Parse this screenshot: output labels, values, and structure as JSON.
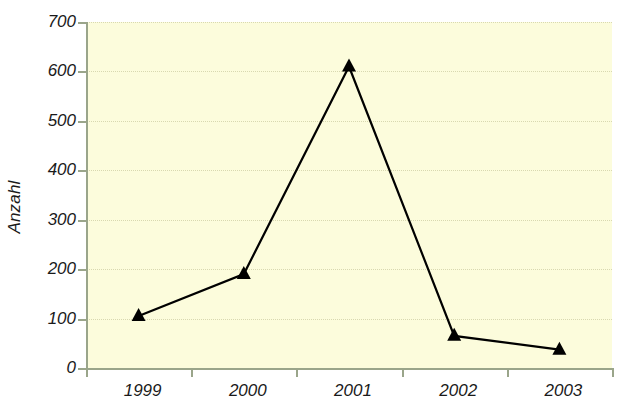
{
  "chart_data": {
    "type": "line",
    "title": "",
    "xlabel": "",
    "ylabel": "Anzahl",
    "categories": [
      "1999",
      "2000",
      "2001",
      "2002",
      "2003"
    ],
    "values": [
      105,
      190,
      610,
      65,
      37
    ],
    "series": [
      {
        "name": "Anzahl",
        "values": [
          105,
          190,
          610,
          65,
          37
        ]
      }
    ],
    "ylim": [
      0,
      700
    ],
    "y_ticks": [
      0,
      100,
      200,
      300,
      400,
      500,
      600,
      700
    ],
    "y_tick_labels": [
      "0",
      "100",
      "200",
      "300",
      "400",
      "500",
      "600",
      "700"
    ],
    "grid": true,
    "grid_axis": "y",
    "legend": false,
    "legend_position": "none",
    "marker": "triangle",
    "marker_color": "#000000",
    "line_color": "#000000",
    "plot_background": "#fcfcdc",
    "figure_background": "#ffffff",
    "axis_color": "#9aa58a",
    "gridline_color": "#d8d8b0",
    "text_color": "#1a1a1a"
  }
}
